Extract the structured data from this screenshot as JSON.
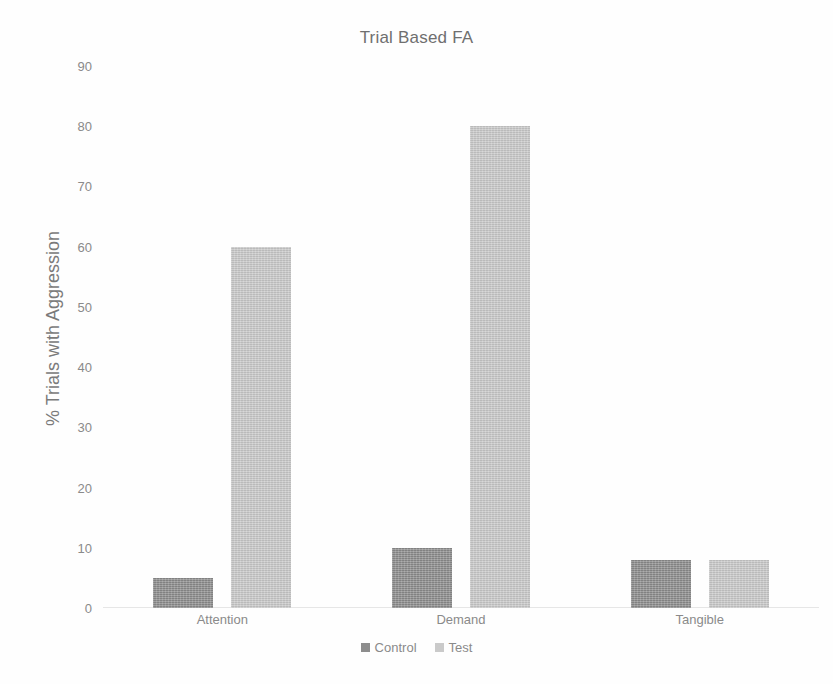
{
  "chart_data": {
    "type": "bar",
    "title": "Trial Based FA",
    "xlabel": "",
    "ylabel": "% Trials with Aggression",
    "categories": [
      "Attention",
      "Demand",
      "Tangible"
    ],
    "series": [
      {
        "name": "Control",
        "color": "#8d8d8d",
        "values": [
          5,
          10,
          8
        ]
      },
      {
        "name": "Test",
        "color": "#cacaca",
        "values": [
          60,
          80,
          8
        ]
      }
    ],
    "ylim": [
      0,
      90
    ],
    "ytick_labels": [
      "90",
      "80",
      "70",
      "60",
      "50",
      "40",
      "30",
      "20",
      "10",
      "0"
    ],
    "ytick_values": [
      90,
      80,
      70,
      60,
      50,
      40,
      30,
      20,
      10,
      0
    ],
    "grid": false,
    "legend_position": "bottom"
  },
  "legend": {
    "entries": [
      {
        "label": "Control"
      },
      {
        "label": "Test"
      }
    ]
  }
}
